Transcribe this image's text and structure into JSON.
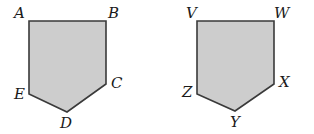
{
  "figures": [
    {
      "name": "pentagon-ABCDE",
      "fill": "#cdcdcd",
      "stroke": "#3a3a3a",
      "vertices": [
        {
          "label": "A",
          "x": 29,
          "y": 21,
          "lx": 14,
          "ly": 18
        },
        {
          "label": "B",
          "x": 106,
          "y": 21,
          "lx": 108,
          "ly": 18
        },
        {
          "label": "C",
          "x": 106,
          "y": 84,
          "lx": 111,
          "ly": 88
        },
        {
          "label": "D",
          "x": 67,
          "y": 112,
          "lx": 60,
          "ly": 128
        },
        {
          "label": "E",
          "x": 29,
          "y": 94,
          "lx": 14,
          "ly": 99
        }
      ]
    },
    {
      "name": "pentagon-VWXYZ",
      "fill": "#cdcdcd",
      "stroke": "#3a3a3a",
      "vertices": [
        {
          "label": "V",
          "x": 197,
          "y": 21,
          "lx": 186,
          "ly": 18
        },
        {
          "label": "W",
          "x": 274,
          "y": 21,
          "lx": 274,
          "ly": 18
        },
        {
          "label": "X",
          "x": 274,
          "y": 84,
          "lx": 279,
          "ly": 87
        },
        {
          "label": "Y",
          "x": 235,
          "y": 111,
          "lx": 230,
          "ly": 127
        },
        {
          "label": "Z",
          "x": 197,
          "y": 94,
          "lx": 182,
          "ly": 97
        }
      ]
    }
  ]
}
